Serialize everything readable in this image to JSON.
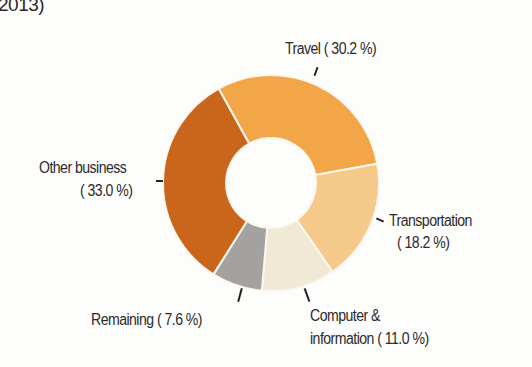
{
  "title_fragment": "2013)",
  "chart_data": {
    "type": "pie",
    "variant": "donut",
    "title": "2013)",
    "categories": [
      "Travel",
      "Transportation",
      "Computer & information",
      "Remaining",
      "Other business"
    ],
    "values": [
      30.2,
      18.2,
      11.0,
      7.6,
      33.0
    ],
    "unit": "%",
    "colors": [
      "#f3a648",
      "#f5c98a",
      "#f1e9d6",
      "#a3a2a0",
      "#c9661c"
    ],
    "start_angle_deg": 331,
    "direction": "clockwise",
    "inner_radius_ratio": 0.42,
    "legend": "none (direct labels)"
  },
  "labels": {
    "travel": "Travel ( 30.2 %)",
    "transport_line1": "Transportation",
    "transport_line2": "( 18.2 %)",
    "computer_line1": "Computer &",
    "computer_line2": "information ( 11.0 %)",
    "remaining": "Remaining (  7.6 %)",
    "other_line1": "Other business",
    "other_line2": "( 33.0 %)"
  }
}
